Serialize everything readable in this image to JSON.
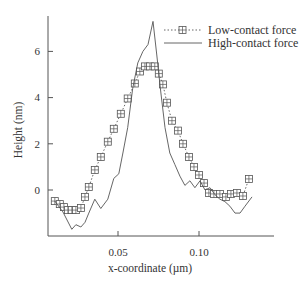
{
  "chart_data": {
    "type": "line",
    "title": "",
    "xlabel": "x-coordinate (µm)",
    "ylabel": "Height (nm)",
    "xlim": [
      0.0068,
      0.146
    ],
    "ylim": [
      -1.9,
      7.5
    ],
    "xticks": [
      0.05,
      0.1
    ],
    "xtick_labels": [
      "0.05",
      "0.10"
    ],
    "yticks": [
      0,
      2,
      4,
      6
    ],
    "ytick_labels": [
      "0",
      "2",
      "4",
      "6"
    ],
    "grid": false,
    "legend_position": "upper right",
    "series": [
      {
        "name": "Low-contact force",
        "style": "dotted line with square-cross markers",
        "x": [
          0.011,
          0.0141,
          0.0166,
          0.0191,
          0.0215,
          0.024,
          0.0271,
          0.0296,
          0.032,
          0.0357,
          0.0394,
          0.0437,
          0.0474,
          0.0517,
          0.056,
          0.0604,
          0.0635,
          0.0666,
          0.0697,
          0.0727,
          0.0752,
          0.0777,
          0.0802,
          0.0833,
          0.087,
          0.0901,
          0.0938,
          0.0969,
          0.1,
          0.1031,
          0.1061,
          0.1092,
          0.1129,
          0.1166,
          0.1197,
          0.1234,
          0.1271,
          0.1308
        ],
        "y": [
          -0.48,
          -0.61,
          -0.74,
          -0.87,
          -0.87,
          -0.87,
          -0.78,
          -0.3,
          0.13,
          0.87,
          1.43,
          2.09,
          2.65,
          3.3,
          3.96,
          4.61,
          5.13,
          5.35,
          5.35,
          5.35,
          5.04,
          4.57,
          3.78,
          3.0,
          2.57,
          2.0,
          1.43,
          1.0,
          0.65,
          0.3,
          -0.13,
          -0.17,
          -0.17,
          -0.3,
          -0.17,
          -0.13,
          -0.26,
          0.48
        ]
      },
      {
        "name": "High-contact force",
        "style": "solid line",
        "x": [
          0.011,
          0.016,
          0.0215,
          0.024,
          0.0271,
          0.0296,
          0.032,
          0.0357,
          0.0394,
          0.0437,
          0.0474,
          0.0505,
          0.053,
          0.056,
          0.0591,
          0.0622,
          0.0654,
          0.0685,
          0.0716,
          0.074,
          0.0765,
          0.079,
          0.082,
          0.0851,
          0.0882,
          0.0913,
          0.0944,
          0.0975,
          0.1006,
          0.1037,
          0.1068,
          0.1098,
          0.1129,
          0.116,
          0.1191,
          0.1222,
          0.1253,
          0.1284,
          0.1327
        ],
        "y": [
          -0.48,
          -0.95,
          -1.7,
          -1.5,
          -1.6,
          -1.4,
          -1.0,
          -0.4,
          -0.8,
          -0.4,
          0.5,
          0.7,
          1.6,
          2.7,
          4.4,
          5.5,
          6.0,
          6.3,
          7.3,
          5.8,
          4.2,
          2.7,
          1.6,
          1.1,
          0.6,
          0.2,
          0.4,
          0.1,
          0.4,
          0.0,
          0.1,
          -0.2,
          -0.4,
          -0.5,
          -0.7,
          -1.0,
          -1.0,
          -0.7,
          -0.3
        ]
      }
    ]
  },
  "legend": {
    "items": [
      {
        "label": "Low-contact force"
      },
      {
        "label": "High-contact force"
      }
    ]
  },
  "axes": {
    "xlabel": "x-coordinate (µm)",
    "ylabel": "Height (nm)",
    "xtick_labels": [
      "0.05",
      "0.10"
    ],
    "ytick_labels": [
      "0",
      "2",
      "4",
      "6"
    ]
  },
  "colors": {
    "axis": "#555555",
    "line": "#555555",
    "text": "#333333"
  }
}
